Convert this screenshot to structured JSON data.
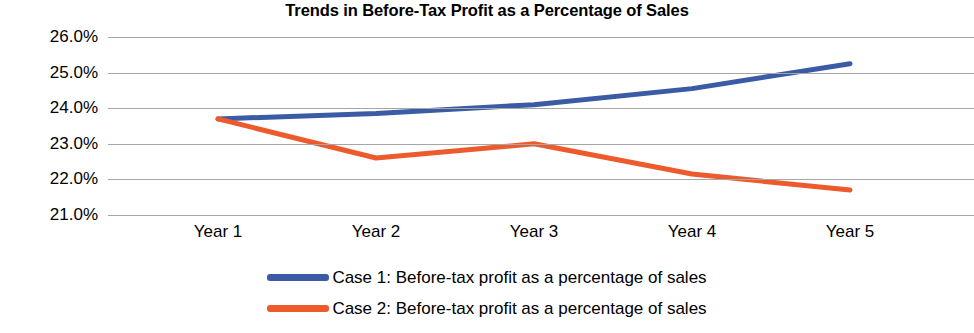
{
  "chart_data": {
    "type": "line",
    "title": "Trends in Before-Tax Profit as a Percentage of Sales",
    "xlabel": "",
    "ylabel": "",
    "categories": [
      "Year 1",
      "Year 2",
      "Year 3",
      "Year 4",
      "Year 5"
    ],
    "ylim": [
      21.0,
      26.0
    ],
    "ytick_step": 1.0,
    "ytick_labels": [
      "26.0%",
      "25.0%",
      "24.0%",
      "23.0%",
      "22.0%",
      "21.0%"
    ],
    "ytick_values": [
      26.0,
      25.0,
      24.0,
      23.0,
      22.0,
      21.0
    ],
    "grid": true,
    "legend_position": "bottom",
    "series": [
      {
        "name": "Case 1: Before-tax profit as a percentage of sales",
        "color": "#3B5BA5",
        "values": [
          23.7,
          23.85,
          24.1,
          24.55,
          25.25
        ]
      },
      {
        "name": "Case 2: Before-tax profit as a percentage of sales",
        "color": "#ED5B2D",
        "values": [
          23.7,
          22.6,
          23.0,
          22.15,
          21.7
        ]
      }
    ]
  },
  "legend": {
    "items": [
      {
        "label": "Case 1: Before-tax profit as a percentage of sales",
        "color": "#3B5BA5",
        "swatch": "legend-line-swatch"
      },
      {
        "label": "Case 2: Before-tax profit as a percentage of sales",
        "color": "#ED5B2D",
        "swatch": "legend-line-swatch"
      }
    ]
  }
}
